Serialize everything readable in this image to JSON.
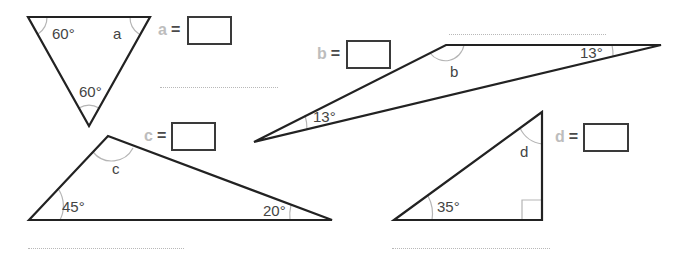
{
  "worksheet": {
    "colors": {
      "line": "#222222",
      "arc": "#b5b5b5",
      "variable_label": "#bdbdbd",
      "equals": "#4a4a4a",
      "dotted_line": "#b8b8b8"
    },
    "triangles": [
      {
        "id": "a",
        "angles": [
          "60°",
          "a",
          "60°"
        ],
        "answer_label": {
          "var": "a",
          "eq": "="
        },
        "answer_value": ""
      },
      {
        "id": "b",
        "angles": [
          "b",
          "13°",
          "13°"
        ],
        "answer_label": {
          "var": "b",
          "eq": "="
        },
        "answer_value": ""
      },
      {
        "id": "c",
        "angles": [
          "c",
          "45°",
          "20°"
        ],
        "answer_label": {
          "var": "c",
          "eq": "="
        },
        "answer_value": ""
      },
      {
        "id": "d",
        "angles": [
          "d",
          "35°",
          "right-angle"
        ],
        "answer_label": {
          "var": "d",
          "eq": "="
        },
        "answer_value": ""
      }
    ]
  }
}
